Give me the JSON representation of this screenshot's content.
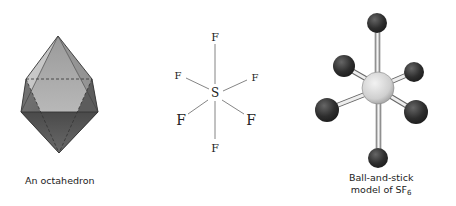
{
  "panels": [
    {
      "id": "octahedron",
      "caption": "An octahedron"
    },
    {
      "id": "lewis",
      "central_atom": "S",
      "ligands": [
        "F",
        "F",
        "F",
        "F",
        "F",
        "F"
      ],
      "labels": {
        "top": "F",
        "upper_left": "F",
        "upper_right": "F",
        "lower_left": "F",
        "lower_right": "F",
        "bottom": "F",
        "center": "S"
      }
    },
    {
      "id": "ball-and-stick",
      "caption_line1": "Ball-and-stick",
      "caption_line2_prefix": "model of SF",
      "caption_line2_subscript": "6"
    }
  ],
  "colors": {
    "ligand_ball": "#2e2e2e",
    "central_ball": "#d4d4d4",
    "bond": "#777777",
    "octahedron_top": "#a9a9a9",
    "octahedron_bottom": "#555555"
  }
}
